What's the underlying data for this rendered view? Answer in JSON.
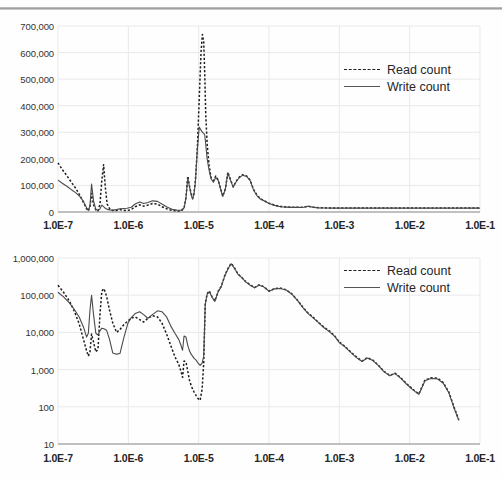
{
  "chart_data": [
    {
      "id": "top",
      "type": "line",
      "title": "",
      "xlabel": "",
      "ylabel": "",
      "xscale": "log",
      "yscale": "linear",
      "xlim": [
        1e-07,
        0.1
      ],
      "ylim": [
        0,
        700000
      ],
      "grid": true,
      "legend_position": "top-right",
      "xticklabels": [
        "1.0E-7",
        "1.0E-6",
        "1.0E-5",
        "1.0E-4",
        "1.0E-3",
        "1.0E-2",
        "1.0E-1"
      ],
      "xtickvalues": [
        1e-07,
        1e-06,
        1e-05,
        0.0001,
        0.001,
        0.01,
        0.1
      ],
      "yticklabels": [
        "0",
        "100,000",
        "200,000",
        "300,000",
        "400,000",
        "500,000",
        "600,000",
        "700,000"
      ],
      "ytickvalues": [
        0,
        100000,
        200000,
        300000,
        400000,
        500000,
        600000,
        700000
      ],
      "series": [
        {
          "name": "Read count",
          "style": "dashed",
          "color": "#1d1d1d",
          "x": [
            1e-07,
            1.15e-07,
            1.35e-07,
            1.55e-07,
            1.8e-07,
            2.05e-07,
            2.3e-07,
            2.55e-07,
            2.7e-07,
            2.85e-07,
            3e-07,
            3.2e-07,
            3.45e-07,
            3.7e-07,
            3.95e-07,
            4.2e-07,
            4.45e-07,
            4.7e-07,
            5e-07,
            5.5e-07,
            6e-07,
            6.8e-07,
            7.6e-07,
            8.6e-07,
            9.6e-07,
            1.1e-06,
            1.25e-06,
            1.45e-06,
            1.65e-06,
            1.9e-06,
            2.2e-06,
            2.6e-06,
            3e-06,
            3.6e-06,
            4.2e-06,
            4.9e-06,
            5.6e-06,
            6.2e-06,
            6.6e-06,
            7e-06,
            7.4e-06,
            7.8e-06,
            8.2e-06,
            8.6e-06,
            9e-06,
            9.6e-06,
            1.02e-05,
            1.08e-05,
            1.13e-05,
            1.18e-05,
            1.22e-05,
            1.26e-05,
            1.32e-05,
            1.4e-05,
            1.5e-05,
            1.62e-05,
            1.75e-05,
            1.9e-05,
            2.05e-05,
            2.2e-05,
            2.4e-05,
            2.6e-05,
            2.85e-05,
            3.1e-05,
            3.4e-05,
            3.8e-05,
            4.2e-05,
            4.8e-05,
            5.4e-05,
            6e-05,
            6.8e-05,
            7.6e-05,
            8.6e-05,
            0.0001,
            0.00012,
            0.000145,
            0.000175,
            0.00021,
            0.00025,
            0.0003,
            0.00036,
            0.00043,
            0.00052,
            0.00065,
            0.0008,
            0.001,
            0.0015,
            0.0022,
            0.0033,
            0.005,
            0.008,
            0.012,
            0.02,
            0.035,
            0.06,
            0.1
          ],
          "y": [
            185000,
            160000,
            135000,
            112000,
            88000,
            62000,
            36000,
            12000,
            4000,
            20000,
            70000,
            28000,
            8000,
            4000,
            30000,
            120000,
            178000,
            95000,
            30000,
            9000,
            5500,
            6000,
            9000,
            7000,
            5500,
            9000,
            20000,
            27000,
            22000,
            26000,
            32000,
            30000,
            20000,
            11000,
            6000,
            4000,
            3500,
            14000,
            55000,
            135000,
            98000,
            70000,
            52000,
            72000,
            120000,
            245000,
            430000,
            600000,
            668000,
            640000,
            520000,
            370000,
            255000,
            180000,
            130000,
            118000,
            135000,
            120000,
            88000,
            60000,
            88000,
            150000,
            120000,
            95000,
            115000,
            132000,
            140000,
            136000,
            120000,
            86000,
            62000,
            50000,
            42000,
            33000,
            26000,
            21000,
            19000,
            18000,
            18000,
            17500,
            22000,
            18000,
            16000,
            15500,
            15000,
            15000,
            15000,
            15000,
            15000,
            15000,
            15000,
            15000,
            15000,
            15000,
            15000,
            15000
          ]
        },
        {
          "name": "Write count",
          "style": "solid",
          "color": "#4a4a4a",
          "x": [
            1e-07,
            1.15e-07,
            1.35e-07,
            1.55e-07,
            1.8e-07,
            2.05e-07,
            2.3e-07,
            2.55e-07,
            2.7e-07,
            2.85e-07,
            3e-07,
            3.2e-07,
            3.45e-07,
            3.7e-07,
            3.95e-07,
            4.2e-07,
            4.45e-07,
            4.7e-07,
            5e-07,
            5.5e-07,
            6e-07,
            6.8e-07,
            7.6e-07,
            8.6e-07,
            9.6e-07,
            1.1e-06,
            1.25e-06,
            1.45e-06,
            1.65e-06,
            1.9e-06,
            2.2e-06,
            2.6e-06,
            3e-06,
            3.6e-06,
            4.2e-06,
            4.9e-06,
            5.6e-06,
            6.2e-06,
            6.6e-06,
            7e-06,
            7.4e-06,
            7.8e-06,
            8.2e-06,
            8.6e-06,
            9e-06,
            9.6e-06,
            1.02e-05,
            1.08e-05,
            1.13e-05,
            1.18e-05,
            1.22e-05,
            1.26e-05,
            1.32e-05,
            1.4e-05,
            1.5e-05,
            1.62e-05,
            1.75e-05,
            1.9e-05,
            2.05e-05,
            2.2e-05,
            2.4e-05,
            2.6e-05,
            2.85e-05,
            3.1e-05,
            3.4e-05,
            3.8e-05,
            4.2e-05,
            4.8e-05,
            5.4e-05,
            6e-05,
            6.8e-05,
            7.6e-05,
            8.6e-05,
            0.0001,
            0.00012,
            0.000145,
            0.000175,
            0.00021,
            0.00025,
            0.0003,
            0.00036,
            0.00043,
            0.00052,
            0.00065,
            0.0008,
            0.001,
            0.0015,
            0.0022,
            0.0033,
            0.005,
            0.008,
            0.012,
            0.02,
            0.035,
            0.06,
            0.1
          ],
          "y": [
            120000,
            108000,
            96000,
            84000,
            72000,
            58000,
            40000,
            16000,
            6000,
            24000,
            105000,
            42000,
            10000,
            5000,
            12000,
            26000,
            20000,
            14000,
            10000,
            8000,
            7000,
            9000,
            12000,
            13000,
            14000,
            18000,
            30000,
            38000,
            32000,
            36000,
            42000,
            40000,
            30000,
            18000,
            10000,
            7000,
            6500,
            15000,
            52000,
            128000,
            95000,
            66000,
            48000,
            68000,
            115000,
            240000,
            320000,
            308000,
            300000,
            296000,
            290000,
            255000,
            200000,
            160000,
            125000,
            112000,
            130000,
            118000,
            86000,
            58000,
            86000,
            146000,
            118000,
            93000,
            113000,
            130000,
            138000,
            134000,
            118000,
            84000,
            60000,
            48000,
            41000,
            32000,
            25000,
            20000,
            18500,
            17500,
            17500,
            17000,
            21500,
            17500,
            15500,
            15000,
            14500,
            14500,
            14500,
            14500,
            14500,
            14500,
            14500,
            14500,
            14500,
            14500,
            14500,
            14500
          ]
        }
      ]
    },
    {
      "id": "bottom",
      "type": "line",
      "title": "",
      "xlabel": "",
      "ylabel": "",
      "xscale": "log",
      "yscale": "log",
      "xlim": [
        1e-07,
        0.1
      ],
      "ylim": [
        10,
        1000000
      ],
      "grid": true,
      "legend_position": "top-right",
      "xticklabels": [
        "1.0E-7",
        "1.0E-6",
        "1.0E-5",
        "1.0E-4",
        "1.0E-3",
        "1.0E-2",
        "1.0E-1"
      ],
      "xtickvalues": [
        1e-07,
        1e-06,
        1e-05,
        0.0001,
        0.001,
        0.01,
        0.1
      ],
      "yticklabels": [
        "10",
        "100",
        "1,000",
        "10,000",
        "100,000",
        "1,000,000"
      ],
      "ytickvalues": [
        10,
        100,
        1000,
        10000,
        100000,
        1000000
      ],
      "series": [
        {
          "name": "Read count",
          "style": "dashed",
          "color": "#1d1d1d",
          "x": [
            1e-07,
            1.2e-07,
            1.45e-07,
            1.7e-07,
            2e-07,
            2.3e-07,
            2.55e-07,
            2.7e-07,
            2.85e-07,
            3e-07,
            3.2e-07,
            3.45e-07,
            3.7e-07,
            3.95e-07,
            4.2e-07,
            4.5e-07,
            4.9e-07,
            5.4e-07,
            6e-07,
            6.8e-07,
            7.6e-07,
            8.6e-07,
            9.8e-07,
            1.1e-06,
            1.25e-06,
            1.45e-06,
            1.65e-06,
            1.9e-06,
            2.2e-06,
            2.6e-06,
            3e-06,
            3.5e-06,
            4e-06,
            4.6e-06,
            5.2e-06,
            5.6e-06,
            5.9e-06,
            6.2e-06,
            6.6e-06,
            7e-06,
            7.4e-06,
            7.8e-06,
            8.2e-06,
            8.6e-06,
            9.2e-06,
            9.8e-06,
            1.05e-05,
            1.12e-05,
            1.18e-05,
            1.24e-05,
            1.32e-05,
            1.42e-05,
            1.55e-05,
            1.7e-05,
            1.9e-05,
            2.1e-05,
            2.35e-05,
            2.6e-05,
            2.9e-05,
            3.2e-05,
            3.6e-05,
            4.1e-05,
            4.7e-05,
            5.4e-05,
            6.2e-05,
            7.2e-05,
            8.4e-05,
            0.0001,
            0.00012,
            0.000145,
            0.000175,
            0.00021,
            0.00026,
            0.00031,
            0.00036,
            0.00042,
            0.0005,
            0.0006,
            0.00072,
            0.00086,
            0.001,
            0.0012,
            0.00145,
            0.00175,
            0.0021,
            0.0025,
            0.003,
            0.0036,
            0.0043,
            0.0052,
            0.0062,
            0.0075,
            0.009,
            0.011,
            0.0135,
            0.0165,
            0.02,
            0.025,
            0.03,
            0.036,
            0.043,
            0.05
          ],
          "y": [
            185000,
            120000,
            70000,
            38000,
            17000,
            6500,
            3200,
            2300,
            3000,
            9000,
            5500,
            3000,
            3500,
            30000,
            130000,
            150000,
            95000,
            40000,
            18000,
            10000,
            12000,
            16000,
            20000,
            24000,
            26000,
            22000,
            19000,
            24000,
            28000,
            26000,
            18000,
            9000,
            4500,
            2200,
            1400,
            900,
            620,
            1700,
            1600,
            900,
            520,
            380,
            300,
            250,
            200,
            165,
            150,
            300,
            1500,
            60000,
            110000,
            130000,
            90000,
            70000,
            130000,
            175000,
            340000,
            520000,
            720000,
            560000,
            380000,
            300000,
            230000,
            190000,
            160000,
            190000,
            170000,
            130000,
            150000,
            155000,
            140000,
            110000,
            70000,
            45000,
            33000,
            26000,
            19000,
            14000,
            11000,
            8000,
            5500,
            4200,
            3000,
            2200,
            1700,
            2100,
            1800,
            1300,
            900,
            700,
            800,
            600,
            420,
            300,
            220,
            150,
            120,
            170,
            110,
            75,
            52,
            48
          ],
          "y_tail": [
            520,
            600,
            590,
            450,
            250,
            95,
            45
          ]
        },
        {
          "name": "Write count",
          "style": "solid",
          "color": "#4a4a4a",
          "x": [
            1e-07,
            1.2e-07,
            1.45e-07,
            1.7e-07,
            2e-07,
            2.3e-07,
            2.55e-07,
            2.7e-07,
            2.85e-07,
            3e-07,
            3.2e-07,
            3.45e-07,
            3.7e-07,
            3.95e-07,
            4.2e-07,
            4.5e-07,
            4.9e-07,
            5.4e-07,
            6e-07,
            6.8e-07,
            7.6e-07,
            8.6e-07,
            9.8e-07,
            1.1e-06,
            1.25e-06,
            1.45e-06,
            1.65e-06,
            1.9e-06,
            2.2e-06,
            2.6e-06,
            3e-06,
            3.5e-06,
            4e-06,
            4.6e-06,
            5.2e-06,
            5.6e-06,
            5.9e-06,
            6.2e-06,
            6.6e-06,
            7e-06,
            7.4e-06,
            7.8e-06,
            8.2e-06,
            8.6e-06,
            9.2e-06,
            9.8e-06,
            1.05e-05,
            1.12e-05,
            1.18e-05,
            1.24e-05,
            1.32e-05,
            1.42e-05,
            1.55e-05,
            1.7e-05,
            1.9e-05,
            2.1e-05,
            2.35e-05,
            2.6e-05,
            2.9e-05,
            3.2e-05,
            3.6e-05,
            4.1e-05,
            4.7e-05,
            5.4e-05,
            6.2e-05,
            7.2e-05,
            8.4e-05,
            0.0001,
            0.00012,
            0.000145,
            0.000175,
            0.00021,
            0.00026,
            0.00031,
            0.00036,
            0.00042,
            0.0005,
            0.0006,
            0.00072,
            0.00086,
            0.001,
            0.0012,
            0.00145,
            0.00175,
            0.0021,
            0.0025,
            0.003,
            0.0036,
            0.0043,
            0.0052,
            0.0062,
            0.0075,
            0.009,
            0.011,
            0.0135,
            0.0165,
            0.02,
            0.025,
            0.03,
            0.036,
            0.043,
            0.05
          ],
          "y": [
            120000,
            90000,
            62000,
            42000,
            26000,
            14000,
            7500,
            9500,
            40000,
            100000,
            30000,
            9500,
            8500,
            11000,
            13000,
            12500,
            11500,
            6500,
            2800,
            2600,
            2700,
            7000,
            17000,
            25000,
            32000,
            36000,
            30000,
            24000,
            30000,
            38000,
            36000,
            26000,
            15000,
            9500,
            6500,
            4500,
            3300,
            8000,
            7500,
            4500,
            3200,
            2600,
            2300,
            2000,
            1800,
            1500,
            1300,
            1500,
            2300,
            55000,
            105000,
            125000,
            88000,
            68000,
            125000,
            170000,
            330000,
            500000,
            700000,
            545000,
            370000,
            295000,
            225000,
            185000,
            158000,
            185000,
            168000,
            128000,
            148000,
            152000,
            138000,
            108000,
            68000,
            44000,
            32000,
            25000,
            18500,
            13500,
            10500,
            7800,
            5300,
            4100,
            2900,
            2100,
            1650,
            2050,
            1750,
            1280,
            880,
            680,
            780,
            580,
            410,
            290,
            215,
            148,
            118,
            165,
            108,
            73,
            51,
            46
          ],
          "y_tail": [
            500,
            580,
            560,
            430,
            240,
            90,
            43
          ]
        }
      ]
    }
  ],
  "legend": {
    "read_label": "Read count",
    "write_label": "Write count"
  },
  "colors": {
    "read": "#1d1d1d",
    "write": "#4a4a4a",
    "grid": "#e9e9e9",
    "axis": "#8c8c8c",
    "text": "#262626"
  }
}
